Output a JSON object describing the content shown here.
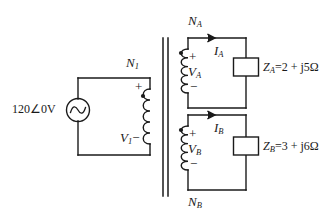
{
  "diagram": {
    "stroke_color": "#1a1a1a",
    "background_color": "#ffffff"
  },
  "source": {
    "name": "ac-voltage-source",
    "magnitude": "120",
    "angle_symbol": "∠",
    "angle": "0",
    "unit": "V",
    "full_label": "120∠0°V"
  },
  "primary": {
    "turns_label": "N",
    "turns_sub": "1",
    "voltage_label": "V",
    "voltage_sub": "1",
    "plus": "+",
    "minus": "−",
    "dot": "•"
  },
  "secondary_a": {
    "turns_label": "N",
    "turns_sub": "A",
    "voltage_label": "V",
    "voltage_sub": "A",
    "current_label": "I",
    "current_sub": "A",
    "plus": "+",
    "minus": "−",
    "dot": "•",
    "impedance_label": "Z",
    "impedance_sub": "A",
    "impedance_value": "=2 + j5Ω"
  },
  "secondary_b": {
    "turns_label": "N",
    "turns_sub": "B",
    "voltage_label": "V",
    "voltage_sub": "B",
    "current_label": "I",
    "current_sub": "B",
    "plus": "+",
    "minus": "−",
    "dot": "•",
    "impedance_label": "Z",
    "impedance_sub": "B",
    "impedance_value": "=3 + j6Ω"
  }
}
